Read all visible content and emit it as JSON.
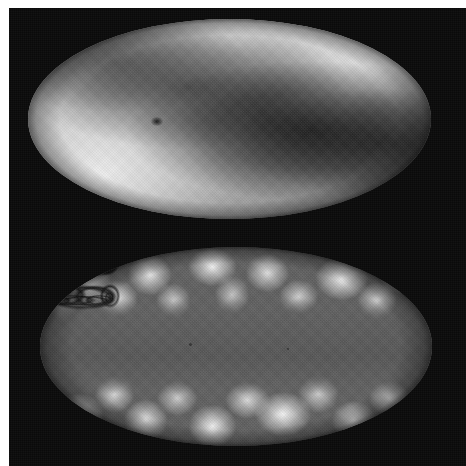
{
  "figure": {
    "width_px": 466,
    "height_px": 466,
    "background_color": "#0a0a0a",
    "margin_color": "#ffffff",
    "colormap": "grayscale",
    "panel_count": 2
  },
  "panels": [
    {
      "id": "top",
      "name": "upper-sky-map",
      "projection": "Mollweide",
      "description": "Smooth large-scale all-sky intensity map with a broad S-shaped dark band sweeping from upper-left to lower-right, bright lobes at upper-right and lower-left, and one small compact dark point source left of centre.",
      "bounds_px": {
        "left": 28,
        "top": 19,
        "width": 403,
        "height": 200
      },
      "mean_level": "#6e6e6e",
      "bright_color": "#e8e8e8",
      "dark_color": "#2a2a2a",
      "features": [
        {
          "name": "bright-lobe-upper-right",
          "position": "86%, 22%",
          "relative_brightness": "high"
        },
        {
          "name": "bright-lobe-lower-left",
          "position": "18%, 78%",
          "relative_brightness": "high"
        },
        {
          "name": "dark-sweep-band",
          "position": "70%, 56%",
          "relative_brightness": "low"
        },
        {
          "name": "compact-dark-point",
          "position": "30.5%, 49%",
          "relative_brightness": "lowest"
        }
      ]
    },
    {
      "id": "bottom",
      "name": "lower-sky-map",
      "projection": "Mollweide",
      "description": "Mottled filamentary foreground map: bright clumpy knots outlined by dark looping filament walls at high positive and negative latitudes, with a smooth featureless mid-grey band masking the equatorial Galactic plane.",
      "bounds_px": {
        "left": 40,
        "top": 247,
        "width": 392,
        "height": 199
      },
      "mean_level": "#5e5e5e",
      "bright_color": "#f2f2f2",
      "dark_color": "#101010",
      "features": [
        {
          "name": "northern-filament-network",
          "position": "top third",
          "relative_brightness": "mixed-high-contrast"
        },
        {
          "name": "southern-filament-network",
          "position": "bottom third",
          "relative_brightness": "mixed-high-contrast"
        },
        {
          "name": "equatorial-flat-band",
          "position": "middle third",
          "relative_brightness": "uniform-mid-grey"
        },
        {
          "name": "brightest-knot-upper-right",
          "position": "77%, 16%",
          "relative_brightness": "highest"
        },
        {
          "name": "brightest-knot-lower-centre",
          "position": "62%, 84%",
          "relative_brightness": "highest"
        }
      ],
      "specks": [
        {
          "name": "speck-left",
          "x_pct": 38,
          "y_pct": 48,
          "size_px": 3
        },
        {
          "name": "speck-right",
          "x_pct": 63,
          "y_pct": 51,
          "size_px": 2
        }
      ]
    }
  ]
}
